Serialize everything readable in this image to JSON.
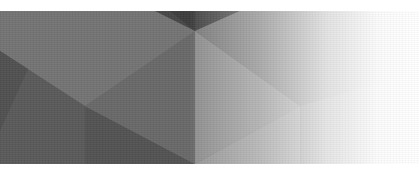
{
  "banner": {
    "description": "Abstract low-poly gray geometric banner fading to white on the right",
    "colors": {
      "base": "#6e6e6e",
      "dark": "#4e4e4e",
      "darker": "#3f3f3f",
      "mid": "#7a7a7a",
      "light": "#8c8c8c",
      "lighter": "#9a9a9a",
      "fade_to": "#ffffff"
    }
  }
}
